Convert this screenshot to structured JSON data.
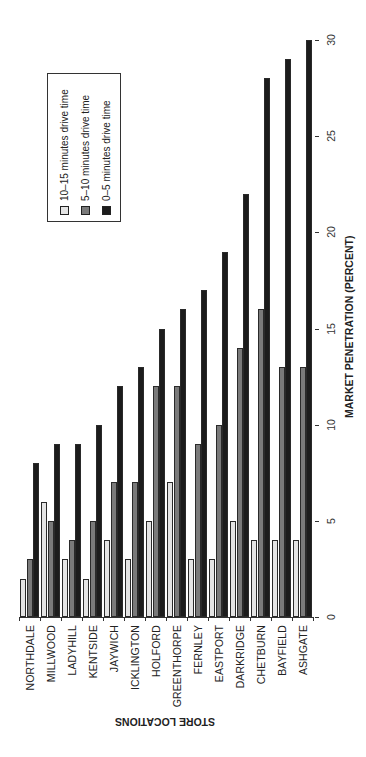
{
  "chart_data": {
    "type": "bar",
    "orientation": "vertical-bars-rotated-page",
    "title": "",
    "xlabel": "STORE LOCATIONS",
    "ylabel": "MARKET PENETRATION (PERCENT)",
    "ylim": [
      0,
      30
    ],
    "yticks": [
      0,
      5,
      10,
      15,
      20,
      25,
      30
    ],
    "grid": false,
    "legend_position": "upper-left (inside plot)",
    "categories": [
      "NORTHDALE",
      "MILLWOOD",
      "LADYHILL",
      "KENTSIDE",
      "JAYWICH",
      "ICKLINGTON",
      "HOLFORD",
      "GREENTHORPE",
      "FERNLEY",
      "EASTPORT",
      "DARKRIDGE",
      "CHETBURN",
      "BAYFIELD",
      "ASHGATE"
    ],
    "series": [
      {
        "name": "10–15 minutes drive time",
        "color": "#e4e4e4",
        "values": [
          2,
          6,
          3,
          2,
          4,
          3,
          5,
          7,
          3,
          3,
          5,
          4,
          4,
          4
        ]
      },
      {
        "name": "5–10 minutes drive time",
        "color": "#7a7a7a",
        "values": [
          3,
          5,
          4,
          5,
          7,
          7,
          12,
          12,
          9,
          10,
          14,
          16,
          13,
          13
        ]
      },
      {
        "name": "0–5 minutes drive time",
        "color": "#1c1c1c",
        "values": [
          8,
          9,
          9,
          10,
          12,
          13,
          15,
          16,
          17,
          19,
          22,
          28,
          29,
          30
        ]
      }
    ]
  },
  "legend": {
    "items": [
      {
        "label": "10–15 minutes drive time",
        "color": "#e4e4e4"
      },
      {
        "label": "5–10 minutes drive time",
        "color": "#7a7a7a"
      },
      {
        "label": "0–5 minutes drive time",
        "color": "#1c1c1c"
      }
    ]
  },
  "axes": {
    "value_axis_title": "MARKET PENETRATION (PERCENT)",
    "category_axis_title": "STORE LOCATIONS",
    "tick_labels": [
      "0",
      "5",
      "10",
      "15",
      "20",
      "25",
      "30"
    ]
  }
}
